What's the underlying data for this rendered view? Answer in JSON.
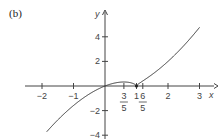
{
  "panel_label": "(b)",
  "chart_data": {
    "type": "line",
    "title": "",
    "function": "y = x(x-1)^(2/3)",
    "xlabel": "x",
    "ylabel": "y",
    "xlim": [
      -2.5,
      3.6
    ],
    "ylim": [
      -4.2,
      6.2
    ],
    "grid": false,
    "legend": null,
    "x_ticks": [
      {
        "value": -2,
        "label": "−2"
      },
      {
        "value": -1,
        "label": "−1"
      },
      {
        "value": 1,
        "label": "1"
      },
      {
        "value": 2,
        "label": "2"
      },
      {
        "value": 3,
        "label": "3"
      }
    ],
    "x_fraction_ticks": [
      {
        "value": 0.6,
        "num": "3",
        "den": "5"
      },
      {
        "value": 1.2,
        "num": "6",
        "den": "5"
      }
    ],
    "y_ticks": [
      {
        "value": 4,
        "label": "4"
      },
      {
        "value": 2,
        "label": "2"
      },
      {
        "value": -2,
        "label": "−2"
      },
      {
        "value": -4,
        "label": "−4"
      }
    ],
    "annotations": [
      {
        "x": 0.6,
        "note": "local maximum"
      },
      {
        "x": 1,
        "note": "cusp (local minimum, y=0)"
      },
      {
        "x": 1.2,
        "note": "inflection point"
      }
    ],
    "series": [
      {
        "name": "f(x)",
        "x": [
          -1.85,
          -1.5,
          -1.0,
          -0.5,
          0,
          0.3,
          0.6,
          0.8,
          0.95,
          1.0,
          1.05,
          1.2,
          1.5,
          2.0,
          2.5,
          3.0
        ],
        "values": [
          -3.72,
          -2.76,
          -1.59,
          -0.65,
          0,
          0.24,
          0.33,
          0.27,
          0.13,
          0,
          0.14,
          0.41,
          0.94,
          2.0,
          3.28,
          4.76
        ]
      }
    ]
  }
}
